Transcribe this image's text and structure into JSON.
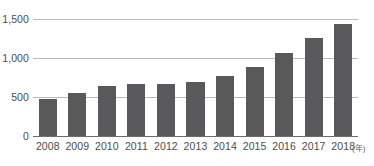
{
  "chart_data": {
    "type": "bar",
    "title": "",
    "subtitle": "",
    "xlabel": "",
    "ylabel": "",
    "x_unit_annotation": "(年)",
    "categories": [
      "2008",
      "2009",
      "2010",
      "2011",
      "2012",
      "2013",
      "2014",
      "2015",
      "2016",
      "2017",
      "2018"
    ],
    "values": [
      470,
      555,
      640,
      670,
      665,
      695,
      770,
      885,
      1060,
      1255,
      1435
    ],
    "series": [
      {
        "name": "",
        "values": [
          470,
          555,
          640,
          670,
          665,
          695,
          770,
          885,
          1060,
          1255,
          1435
        ]
      }
    ],
    "ylim": [
      0,
      1500
    ],
    "yticks": [
      0,
      500,
      1000,
      1500
    ],
    "ytick_labels": [
      "0",
      "500",
      "1,000",
      "1,500"
    ],
    "grid": true,
    "legend": false,
    "legend_position": "none",
    "bar_color": "#59595b",
    "gridline_color": "#b9b9bb",
    "axis_color": "#6d6d70",
    "label_color": "#4c4c4e",
    "background_color": "#ffffff"
  }
}
